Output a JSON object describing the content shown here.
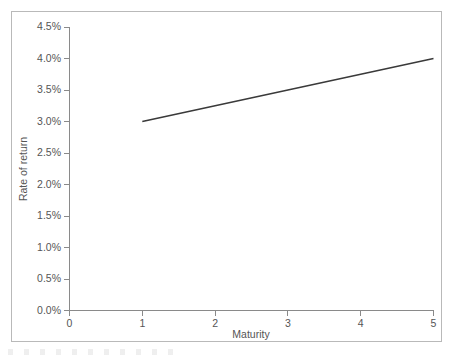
{
  "chart_data": {
    "type": "line",
    "title": "",
    "xlabel": "Maturity",
    "ylabel": "Rate of return",
    "xlim": [
      0,
      5
    ],
    "ylim": [
      0,
      4.5
    ],
    "grid": false,
    "legend": null,
    "x_ticks": [
      "0",
      "1",
      "2",
      "3",
      "4",
      "5"
    ],
    "x_tick_values": [
      0,
      1,
      2,
      3,
      4,
      5
    ],
    "y_ticks": [
      "0.0%",
      "0.5%",
      "1.0%",
      "1.5%",
      "2.0%",
      "2.5%",
      "3.0%",
      "3.5%",
      "4.0%",
      "4.5%"
    ],
    "y_tick_values": [
      0.0,
      0.5,
      1.0,
      1.5,
      2.0,
      2.5,
      3.0,
      3.5,
      4.0,
      4.5
    ],
    "series": [
      {
        "name": "Yield curve",
        "color": "#3a3a3a",
        "x": [
          1,
          2,
          3,
          4,
          5
        ],
        "values": [
          3.0,
          3.25,
          3.5,
          3.75,
          4.0
        ]
      }
    ]
  },
  "axis_labels": {
    "x_title": "Maturity",
    "y_title": "Rate of return"
  },
  "colors": {
    "line": "#3a3a3a",
    "axis": "#8a8a8a",
    "frame": "#b9b9b9",
    "text": "#555555",
    "background": "#ffffff"
  }
}
